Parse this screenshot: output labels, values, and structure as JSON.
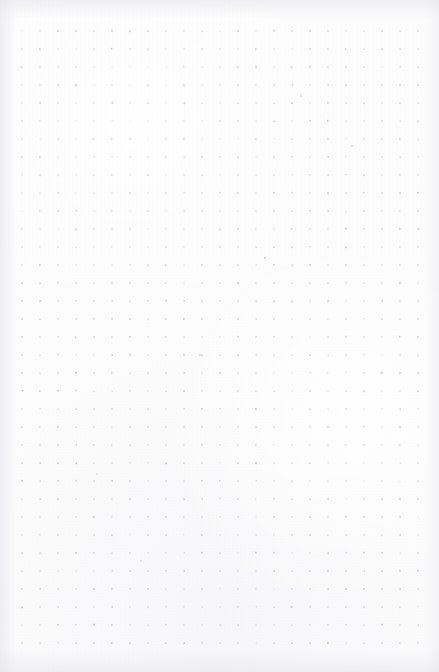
{
  "document": {
    "kind": "dot-grid-paper",
    "title": "Dot Grid Page",
    "width": 439,
    "height": 672,
    "page_text": "",
    "annotations": []
  },
  "paper": {
    "background_color": "#fcfcfd",
    "highlight_color": "#ffffff",
    "edge_shadow_color": "#e4e4e8",
    "texture": "subtle-fiber-grain"
  },
  "grid": {
    "dot_color": "#c9c9d2",
    "dot_radius": 0.85,
    "spacing_x": 18,
    "spacing_y": 18,
    "origin_x": 22,
    "origin_y": 31,
    "columns": 23,
    "rows": 35,
    "margin_left": 22,
    "margin_right": 21,
    "margin_top": 31,
    "margin_bottom": 29,
    "opacity_min": 0.45,
    "opacity_max": 1.0
  },
  "specks": [
    {
      "x": 265,
      "y": 258,
      "size": 1.6,
      "color": "#b9b9c2",
      "opacity": 0.75
    },
    {
      "x": 200,
      "y": 355,
      "size": 1.2,
      "color": "#c4c4cc",
      "opacity": 0.5
    },
    {
      "x": 97,
      "y": 474,
      "size": 1.1,
      "color": "#c6c6ce",
      "opacity": 0.45
    },
    {
      "x": 352,
      "y": 146,
      "size": 1.2,
      "color": "#c2c2cb",
      "opacity": 0.5
    },
    {
      "x": 301,
      "y": 96,
      "size": 1.3,
      "color": "#bfbfc9",
      "opacity": 0.55
    },
    {
      "x": 378,
      "y": 143,
      "size": 1.0,
      "color": "#c8c8d0",
      "opacity": 0.4
    },
    {
      "x": 141,
      "y": 561,
      "size": 1.1,
      "color": "#c5c5cd",
      "opacity": 0.45
    }
  ]
}
